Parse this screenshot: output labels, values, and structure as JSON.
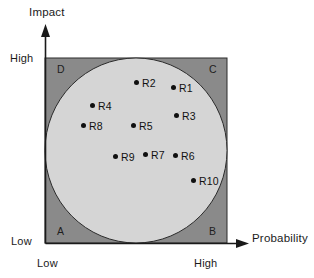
{
  "figure": {
    "kind": "risk-map-scatter",
    "background_color": "#ffffff"
  },
  "axes": {
    "y_title": "Impact",
    "x_title": "Probability",
    "y_high_label": "High",
    "y_low_label": "Low",
    "x_low_label": "Low",
    "x_high_label": "High"
  },
  "quadrants": [
    {
      "id": "D",
      "label": "D",
      "position": "top-left"
    },
    {
      "id": "C",
      "label": "C",
      "position": "top-right"
    },
    {
      "id": "A",
      "label": "A",
      "position": "bottom-left"
    },
    {
      "id": "B",
      "label": "B",
      "position": "bottom-right"
    }
  ],
  "colors": {
    "corner_fill": "#8a8a8a",
    "circle_fill": "#d5d5d5",
    "outline": "#2b2b2b",
    "point_fill": "#101010",
    "text": "#111111"
  },
  "chart_data": {
    "type": "scatter",
    "title": "",
    "subtitle": "",
    "xlabel": "Probability",
    "ylabel": "Impact",
    "xlim": [
      0,
      1
    ],
    "ylim": [
      0,
      1
    ],
    "xtick_labels": [
      "Low",
      "High"
    ],
    "ytick_labels": [
      "Low",
      "High"
    ],
    "grid": false,
    "legend": null,
    "annotations": [
      "D",
      "C",
      "A",
      "B"
    ],
    "regions": [
      {
        "name": "inscribed-circle",
        "shape": "circle",
        "cx": 0.5,
        "cy": 0.5,
        "r": 0.5,
        "fill": "#d5d5d5"
      },
      {
        "name": "plot-square",
        "shape": "rect",
        "x": 0,
        "y": 0,
        "w": 1,
        "h": 1,
        "fill": "#8a8a8a"
      }
    ],
    "points": [
      {
        "label": "R1",
        "x": 0.703,
        "y": 0.843,
        "px": 173,
        "py": 87,
        "label_dx": 6,
        "label_dy": -4
      },
      {
        "label": "R2",
        "x": 0.5,
        "y": 0.87,
        "px": 136,
        "py": 82,
        "label_dx": 6,
        "label_dy": -4
      },
      {
        "label": "R3",
        "x": 0.72,
        "y": 0.692,
        "px": 176,
        "py": 115,
        "label_dx": 6,
        "label_dy": -4
      },
      {
        "label": "R4",
        "x": 0.258,
        "y": 0.746,
        "px": 92,
        "py": 105,
        "label_dx": 6,
        "label_dy": -4
      },
      {
        "label": "R5",
        "x": 0.484,
        "y": 0.638,
        "px": 133,
        "py": 125,
        "label_dx": 6,
        "label_dy": -4
      },
      {
        "label": "R6",
        "x": 0.714,
        "y": 0.476,
        "px": 175,
        "py": 155,
        "label_dx": 6,
        "label_dy": -4
      },
      {
        "label": "R7",
        "x": 0.549,
        "y": 0.481,
        "px": 145,
        "py": 154,
        "label_dx": 6,
        "label_dy": -4
      },
      {
        "label": "R8",
        "x": 0.209,
        "y": 0.638,
        "px": 83,
        "py": 125,
        "label_dx": 6,
        "label_dy": -4
      },
      {
        "label": "R9",
        "x": 0.385,
        "y": 0.47,
        "px": 115,
        "py": 156,
        "label_dx": 6,
        "label_dy": -4
      },
      {
        "label": "R10",
        "x": 0.813,
        "y": 0.341,
        "px": 193,
        "py": 180,
        "label_dx": 6,
        "label_dy": -4
      }
    ]
  }
}
